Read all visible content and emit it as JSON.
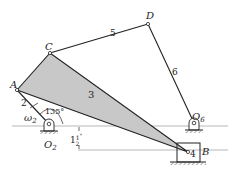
{
  "diagram": {
    "type": "six-bar linkage mechanism",
    "points": {
      "A": {
        "label": "A"
      },
      "B": {
        "label": "B"
      },
      "C": {
        "label": "C"
      },
      "D": {
        "label": "D"
      },
      "O2": {
        "label": "O",
        "sub": "2"
      },
      "O6": {
        "label": "O",
        "sub": "6"
      }
    },
    "links": {
      "l2": "2",
      "l3": "3",
      "l4": "4",
      "l5": "5",
      "l6": "6"
    },
    "omega": {
      "label": "ω",
      "sub": "2"
    },
    "angle": "135°",
    "offset": {
      "whole": "1",
      "num": "1",
      "den": "2",
      "unit": "\""
    },
    "colors": {
      "link3_fill": "#c8c8c8",
      "line": "#222222",
      "ground": "#555555"
    }
  }
}
